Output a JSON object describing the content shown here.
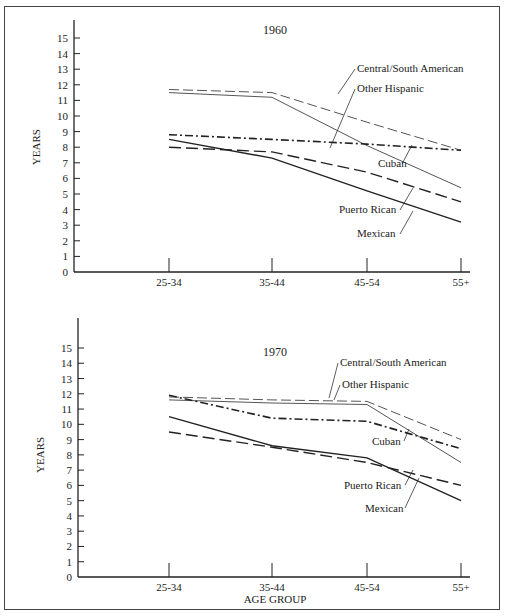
{
  "page": {
    "header_fragment": "...y types, by age group..."
  },
  "chart_data": [
    {
      "type": "line",
      "title": "1960",
      "xlabel": "",
      "ylabel": "YEARS",
      "ylim": [
        0,
        15
      ],
      "yticks": [
        0,
        1,
        2,
        3,
        4,
        5,
        6,
        7,
        8,
        9,
        10,
        11,
        12,
        13,
        14,
        15
      ],
      "categories": [
        "25-34",
        "35-44",
        "45-54",
        "55+"
      ],
      "grid": false,
      "legend": "inline labels",
      "series": [
        {
          "name": "Central/South American",
          "style": "thin-dashed",
          "values": [
            11.7,
            11.5,
            9.6,
            7.8
          ]
        },
        {
          "name": "Other Hispanic",
          "style": "thin-solid",
          "values": [
            11.5,
            11.2,
            8.1,
            5.4
          ]
        },
        {
          "name": "Cuban",
          "style": "dash-dot",
          "values": [
            8.8,
            8.5,
            8.2,
            7.8
          ]
        },
        {
          "name": "Puerto Rican",
          "style": "long-dash",
          "values": [
            8.0,
            7.7,
            6.4,
            4.5
          ]
        },
        {
          "name": "Mexican",
          "style": "solid",
          "values": [
            8.5,
            7.3,
            5.2,
            3.2
          ]
        }
      ]
    },
    {
      "type": "line",
      "title": "1970",
      "xlabel": "AGE GROUP",
      "ylabel": "YEARS",
      "ylim": [
        0,
        15
      ],
      "yticks": [
        0,
        1,
        2,
        3,
        4,
        5,
        6,
        7,
        8,
        9,
        10,
        11,
        12,
        13,
        14,
        15
      ],
      "categories": [
        "25-34",
        "35-44",
        "45-54",
        "55+"
      ],
      "grid": false,
      "legend": "inline labels",
      "series": [
        {
          "name": "Central/South American",
          "style": "thin-dashed",
          "values": [
            11.8,
            11.6,
            11.5,
            9.0
          ]
        },
        {
          "name": "Other Hispanic",
          "style": "thin-solid",
          "values": [
            11.6,
            11.4,
            11.3,
            7.5
          ]
        },
        {
          "name": "Cuban",
          "style": "dash-dot",
          "values": [
            11.9,
            10.4,
            10.2,
            8.4
          ]
        },
        {
          "name": "Puerto Rican",
          "style": "long-dash",
          "values": [
            9.5,
            8.5,
            7.5,
            6.0
          ]
        },
        {
          "name": "Mexican",
          "style": "solid",
          "values": [
            10.5,
            8.6,
            7.8,
            5.0
          ]
        }
      ]
    }
  ]
}
